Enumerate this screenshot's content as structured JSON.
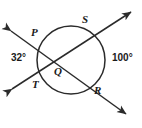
{
  "figure": {
    "type": "circle-geometry-diagram",
    "stroke_color": "#2b2b2b",
    "background_color": "#ffffff",
    "circle": {
      "center_x": 71,
      "center_y": 60,
      "radius": 34
    },
    "points": [
      {
        "id": "P",
        "label": "P",
        "x": 31,
        "y": 27
      },
      {
        "id": "S",
        "label": "S",
        "x": 82,
        "y": 14
      },
      {
        "id": "Q",
        "label": "Q",
        "x": 54,
        "y": 66
      },
      {
        "id": "T",
        "label": "T",
        "x": 32,
        "y": 79
      },
      {
        "id": "R",
        "label": "R",
        "x": 94,
        "y": 85
      }
    ],
    "angles": [
      {
        "id": "angle-left",
        "value": "32°",
        "x": 11,
        "y": 53
      },
      {
        "id": "angle-right",
        "value": "100°",
        "x": 112,
        "y": 53
      }
    ],
    "lines": [
      {
        "id": "line-P-R",
        "from": "P",
        "to": "R",
        "arrow_start": true,
        "arrow_end": true
      },
      {
        "id": "line-T-S",
        "from": "T",
        "to": "S",
        "arrow_start": true,
        "arrow_end": true
      }
    ]
  }
}
